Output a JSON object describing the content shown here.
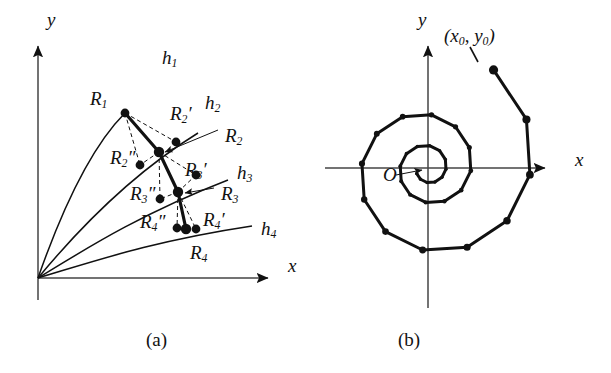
{
  "figure": {
    "background": "#ffffff",
    "ink": "#111111",
    "panels": [
      {
        "id": "a",
        "caption": "(a)",
        "caption_x": 146,
        "caption_y": 330
      },
      {
        "id": "b",
        "caption": "(b)",
        "caption_x": 398,
        "caption_y": 330
      }
    ]
  },
  "panel_a": {
    "axes": {
      "x_label": "x",
      "y_label": "y",
      "x_label_pos": [
        288,
        264
      ],
      "y_label_pos": [
        47,
        18
      ],
      "origin": [
        38,
        278
      ],
      "x_end": [
        277,
        278
      ],
      "y_top": [
        38,
        36
      ]
    },
    "curve_labels": [
      {
        "name": "h1",
        "base": "h",
        "sub": "1",
        "x": 162,
        "y": 48
      },
      {
        "name": "h2",
        "base": "h",
        "sub": "2",
        "x": 205,
        "y": 93
      },
      {
        "name": "h3",
        "base": "h",
        "sub": "3",
        "x": 237,
        "y": 163
      },
      {
        "name": "h4",
        "base": "h",
        "sub": "4",
        "x": 261,
        "y": 219
      }
    ],
    "point_labels": [
      {
        "name": "R1",
        "base": "R",
        "sub": "1",
        "marks": "",
        "x": 90,
        "y": 89
      },
      {
        "name": "R2-prime",
        "base": "R",
        "sub": "2",
        "marks": "′",
        "x": 170,
        "y": 104
      },
      {
        "name": "R2",
        "base": "R",
        "sub": "2",
        "marks": "",
        "x": 225,
        "y": 126
      },
      {
        "name": "R2-dprime",
        "base": "R",
        "sub": "2",
        "marks": "″",
        "x": 110,
        "y": 148
      },
      {
        "name": "R3-prime",
        "base": "R",
        "sub": "3",
        "marks": "′",
        "x": 185,
        "y": 160
      },
      {
        "name": "R3",
        "base": "R",
        "sub": "3",
        "marks": "",
        "x": 221,
        "y": 184
      },
      {
        "name": "R3-dprime",
        "base": "R",
        "sub": "3",
        "marks": "″",
        "x": 130,
        "y": 184
      },
      {
        "name": "R4-prime",
        "base": "R",
        "sub": "4",
        "marks": "′",
        "x": 203,
        "y": 210
      },
      {
        "name": "R4-dprime",
        "base": "R",
        "sub": "4",
        "marks": "″",
        "x": 140,
        "y": 212
      },
      {
        "name": "R4",
        "base": "R",
        "sub": "4",
        "marks": "",
        "x": 190,
        "y": 243
      }
    ]
  },
  "panel_b": {
    "axes": {
      "x_label": "x",
      "y_label": "y",
      "x_label_pos": [
        575,
        158
      ],
      "y_label_pos": [
        418,
        18
      ],
      "origin": [
        428,
        168
      ],
      "x_left": [
        325,
        168
      ],
      "x_right": [
        553,
        168
      ],
      "y_top": [
        428,
        36
      ],
      "y_bottom": [
        428,
        308
      ]
    },
    "start_label": {
      "text": "(x0, y0)",
      "base_open": "(",
      "x_var": "x",
      "x_sub": "0",
      "sep": ", ",
      "y_var": "y",
      "y_sub": "0",
      "base_close": ")",
      "x": 444,
      "y": 34
    },
    "origin_label": {
      "text": "O",
      "x": 383,
      "y": 172
    },
    "spiral": {
      "type": "logarithmic-inward",
      "points_per_turn": 12,
      "turns": 2.6,
      "start_radius": 118,
      "decay_per_turn": 0.42
    }
  }
}
